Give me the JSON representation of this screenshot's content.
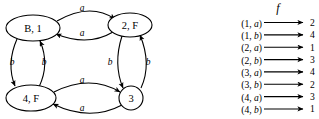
{
  "diagram": {
    "title": "",
    "nodes": [
      {
        "id": "b1",
        "label": "B, 1",
        "shape": "ellipse",
        "cx": 33,
        "cy": 28,
        "rx": 27,
        "ry": 13
      },
      {
        "id": "n2f",
        "label": "2, F",
        "shape": "ellipse",
        "cx": 130,
        "cy": 25,
        "rx": 22,
        "ry": 12
      },
      {
        "id": "n4f",
        "label": "4, F",
        "shape": "ellipse",
        "cx": 31,
        "cy": 98,
        "rx": 25,
        "ry": 13
      },
      {
        "id": "n3",
        "label": "3",
        "shape": "circle",
        "cx": 131,
        "cy": 98,
        "rx": 12,
        "ry": 12
      }
    ],
    "edges": [
      {
        "from": "b1",
        "to": "n2f",
        "label": "a",
        "position": "top-outer",
        "label_x": 82,
        "label_y": 8
      },
      {
        "from": "n2f",
        "to": "b1",
        "label": "a",
        "position": "top-inner",
        "label_x": 82,
        "label_y": 33
      },
      {
        "from": "b1",
        "to": "n4f",
        "label": "b",
        "position": "left-outer",
        "label_x": 12,
        "label_y": 62
      },
      {
        "from": "n4f",
        "to": "b1",
        "label": "b",
        "position": "left-inner",
        "label_x": 44,
        "label_y": 62
      },
      {
        "from": "n2f",
        "to": "n3",
        "label": "b",
        "position": "right-inner",
        "label_x": 110,
        "label_y": 62
      },
      {
        "from": "n3",
        "to": "n2f",
        "label": "b",
        "position": "right-outer",
        "label_x": 148,
        "label_y": 62
      },
      {
        "from": "n4f",
        "to": "n3",
        "label": "a",
        "position": "bottom-inner",
        "label_x": 82,
        "label_y": 80
      },
      {
        "from": "n3",
        "to": "n4f",
        "label": "a",
        "position": "bottom-outer",
        "label_x": 82,
        "label_y": 108
      }
    ]
  },
  "function_map": {
    "title": "f",
    "title_x": 278,
    "title_y": 8,
    "rows": [
      {
        "input_state": "1",
        "input_symbol": "a",
        "output": "2"
      },
      {
        "input_state": "1",
        "input_symbol": "b",
        "output": "4"
      },
      {
        "input_state": "2",
        "input_symbol": "a",
        "output": "1"
      },
      {
        "input_state": "2",
        "input_symbol": "b",
        "output": "3"
      },
      {
        "input_state": "3",
        "input_symbol": "a",
        "output": "4"
      },
      {
        "input_state": "3",
        "input_symbol": "b",
        "output": "2"
      },
      {
        "input_state": "4",
        "input_symbol": "a",
        "output": "3"
      },
      {
        "input_state": "4",
        "input_symbol": "b",
        "output": "1"
      }
    ]
  },
  "colors": {
    "background": "#ffffff",
    "ink": "#000000"
  }
}
